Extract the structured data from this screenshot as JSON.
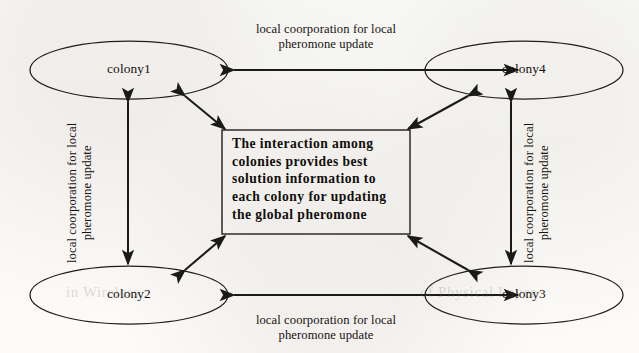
{
  "figure": {
    "type": "multi-colony-interaction-diagram",
    "background_color": "#fdfdfc",
    "ink_color": "#1a1a1a"
  },
  "nodes": [
    {
      "id": "colony1",
      "label": "colony1",
      "position": "top-left",
      "cx": 129,
      "cy": 70,
      "rx": 99,
      "ry": 29
    },
    {
      "id": "colony4",
      "label": "colony4",
      "position": "top-right",
      "cx": 524,
      "cy": 70,
      "rx": 99,
      "ry": 29
    },
    {
      "id": "colony2",
      "label": "colony2",
      "position": "bottom-left",
      "cx": 129,
      "cy": 295,
      "rx": 99,
      "ry": 29
    },
    {
      "id": "colony3",
      "label": "colony3",
      "position": "bottom-right",
      "cx": 524,
      "cy": 295,
      "rx": 99,
      "ry": 29
    }
  ],
  "center_box": {
    "label": "The interaction among\ncolonies provides best\nsolution information to\neach colony for updating\nthe global pheromone",
    "x": 222,
    "y": 130,
    "width": 188,
    "height": 104
  },
  "edge_labels": {
    "top": "local coorporation for local\npheromone update",
    "bottom": "local coorporation for local\npheromone update",
    "left": "local coorporation for local\npheromone update",
    "right": "local coorporation for local\npheromone update"
  },
  "edges": [
    {
      "id": "top-edge",
      "from": "colony1",
      "to": "colony4",
      "style": "double-arrow",
      "orientation": "horizontal"
    },
    {
      "id": "bottom-edge",
      "from": "colony2",
      "to": "colony3",
      "style": "double-arrow",
      "orientation": "horizontal"
    },
    {
      "id": "left-edge",
      "from": "colony1",
      "to": "colony2",
      "style": "double-arrow",
      "orientation": "vertical"
    },
    {
      "id": "right-edge",
      "from": "colony4",
      "to": "colony3",
      "style": "double-arrow",
      "orientation": "vertical"
    },
    {
      "id": "colony1-center-edge",
      "from": "colony1",
      "to": "center_box",
      "style": "double-arrow",
      "orientation": "diagonal"
    },
    {
      "id": "colony4-center-edge",
      "from": "colony4",
      "to": "center_box",
      "style": "double-arrow",
      "orientation": "diagonal"
    },
    {
      "id": "colony2-center-edge",
      "from": "colony2",
      "to": "center_box",
      "style": "double-arrow",
      "orientation": "diagonal"
    },
    {
      "id": "colony3-center-edge",
      "from": "colony3",
      "to": "center_box",
      "style": "double-arrow",
      "orientation": "diagonal"
    }
  ],
  "scan_artifacts": {
    "bleed_left": "in Wireless",
    "bleed_right": "of Physical Layer"
  }
}
